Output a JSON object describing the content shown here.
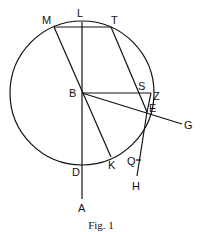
{
  "figure": {
    "caption": "Fig. 1",
    "circle": {
      "center": "B"
    },
    "points": [
      {
        "name": "M",
        "x": 54,
        "y": 27,
        "lx": 42,
        "ly": 24
      },
      {
        "name": "L",
        "x": 82,
        "y": 22,
        "lx": 77,
        "ly": 17
      },
      {
        "name": "T",
        "x": 111,
        "y": 27,
        "lx": 111,
        "ly": 24
      },
      {
        "name": "B",
        "x": 82,
        "y": 93,
        "lx": 69,
        "ly": 97
      },
      {
        "name": "S",
        "x": 146,
        "y": 93,
        "lx": 138,
        "ly": 90
      },
      {
        "name": "Z",
        "x": 151,
        "y": 93,
        "lx": 153,
        "ly": 100
      },
      {
        "name": "E",
        "x": 147,
        "y": 112,
        "lx": 149,
        "ly": 112
      },
      {
        "name": "G",
        "x": 182,
        "y": 124,
        "lx": 184,
        "ly": 129
      },
      {
        "name": "K",
        "x": 111,
        "y": 157,
        "lx": 108,
        "ly": 169
      },
      {
        "name": "D",
        "x": 82,
        "y": 164,
        "lx": 72,
        "ly": 176
      },
      {
        "name": "Q",
        "x": 139,
        "y": 160,
        "lx": 127,
        "ly": 165
      },
      {
        "name": "H",
        "x": 137,
        "y": 176,
        "lx": 132,
        "ly": 190
      },
      {
        "name": "A",
        "x": 82,
        "y": 199,
        "lx": 78,
        "ly": 212
      }
    ]
  }
}
